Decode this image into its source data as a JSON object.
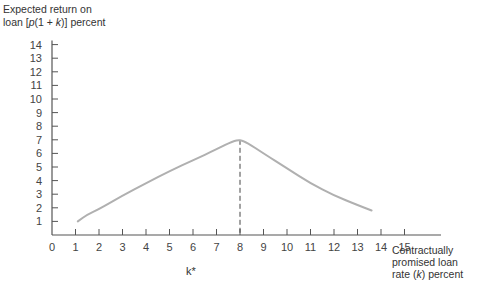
{
  "chart_data": {
    "type": "line",
    "title": "",
    "ylabel": "Expected return on loan [p(1 + k)] percent",
    "ylabel_lines": [
      "Expected return on",
      "loan [p(1 + k)] percent"
    ],
    "xlabel": "Contractually promised loan rate (k) percent",
    "xlabel_lines": [
      "Contractually",
      "promised loan",
      "rate (k) percent"
    ],
    "x_ticks": [
      0,
      1,
      2,
      3,
      4,
      5,
      6,
      7,
      8,
      9,
      10,
      11,
      12,
      13,
      14,
      15
    ],
    "y_ticks": [
      1,
      2,
      3,
      4,
      5,
      6,
      7,
      8,
      9,
      10,
      11,
      12,
      13,
      14
    ],
    "xlim": [
      0,
      16.5
    ],
    "ylim": [
      0,
      14
    ],
    "grid": false,
    "annotations": [
      {
        "text": "k*",
        "x": 8,
        "note": "dashed vertical line from peak to x-axis"
      }
    ],
    "series": [
      {
        "name": "Expected return",
        "color": "#b0b0b0",
        "x": [
          1.1,
          1.5,
          2,
          3,
          4,
          5,
          6,
          7,
          7.7,
          8,
          8.3,
          9,
          10,
          11,
          12,
          13,
          13.6
        ],
        "y": [
          1.0,
          1.5,
          1.9,
          2.9,
          3.8,
          4.7,
          5.5,
          6.3,
          6.9,
          7.0,
          6.8,
          6.0,
          4.9,
          3.8,
          2.9,
          2.2,
          1.8
        ]
      }
    ],
    "peak": {
      "x": 8,
      "y": 7.0
    }
  },
  "labels": {
    "ylabel_line1": "Expected return on",
    "ylabel_line2_prefix": "loan [",
    "ylabel_line2_p": "p",
    "ylabel_line2_mid": "(1 + ",
    "ylabel_line2_k": "k",
    "ylabel_line2_suffix": ")] percent",
    "xlabel_line1": "Contractually",
    "xlabel_line2": "promised loan",
    "xlabel_line3_prefix": "rate (",
    "xlabel_line3_k": "k",
    "xlabel_line3_suffix": ") percent",
    "kstar": "k*"
  }
}
